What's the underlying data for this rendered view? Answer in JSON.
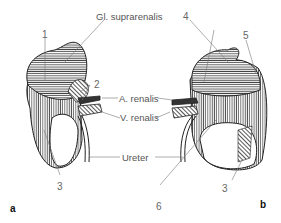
{
  "labels": {
    "gl_suprarenalis": "Gl. suprarenalis",
    "a_renalis": "A. renalis",
    "v_renalis": "V. renalis",
    "ureter": "Ureter"
  },
  "numbers": {
    "n1": "1",
    "n2": "2",
    "n3_left": "3",
    "n3_right": "3",
    "n4": "4",
    "n5": "5",
    "n6": "6"
  },
  "panels": {
    "a": "a",
    "b": "b"
  },
  "colors": {
    "line": "#222222",
    "hatch": "#555555",
    "leader": "#777777",
    "text": "#555555"
  }
}
